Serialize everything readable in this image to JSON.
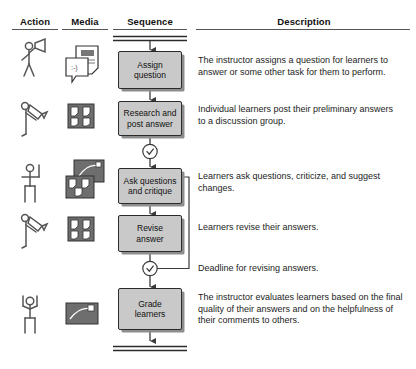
{
  "diagram": {
    "type": "activity-flow-table",
    "columns": [
      {
        "id": "action",
        "label": "Action"
      },
      {
        "id": "media",
        "label": "Media"
      },
      {
        "id": "sequence",
        "label": "Sequence"
      },
      {
        "id": "description",
        "label": "Description"
      }
    ],
    "colors": {
      "box_fill": "#c9c9c9",
      "box_border": "#2b2b2b",
      "box_shadow": "#8d8d8d",
      "connector": "#3a3a3a",
      "media_tile": "#6e6e6e",
      "text": "#1a1a1a",
      "rule": "#555555",
      "background": "#ffffff"
    },
    "start_marker": "double-bar",
    "end_marker": "double-bar",
    "rows": [
      {
        "index": 1,
        "actor_icon": "stick-figure-with-megaphone-icon",
        "media_icon": "document-with-comment-note-icon",
        "step_label": "Assign question",
        "step_line_1": "Assign",
        "step_line_2": "question",
        "description": "The instructor assigns a question for learners to answer or some other task for them to perform."
      },
      {
        "index": 2,
        "actor_icon": "stick-figure-writing-icon",
        "media_icon": "note-grid-four-tiles-icon",
        "step_label": "Research and post answer",
        "step_line_1": "Research and",
        "step_line_2": "post answer",
        "description": "Individual learners post their preliminary answers to a discussion group."
      },
      {
        "index": 3,
        "actor_icon": "stick-figure-hand-raised-icon",
        "media_icon": "stacked-note-tiles-icon",
        "step_label": "Ask questions and critique",
        "step_line_1": "Ask questions",
        "step_line_2": "and critique",
        "description": "Learners ask questions, criticize, and suggest changes."
      },
      {
        "index": 4,
        "actor_icon": "stick-figure-writing-icon",
        "media_icon": "note-grid-four-tiles-icon",
        "step_label": "Revise answer",
        "step_line_1": "Revise",
        "step_line_2": "answer",
        "description": "Learners revise their answers."
      },
      {
        "index": 5,
        "actor_icon": "stick-figure-arms-raised-icon",
        "media_icon": "single-tile-with-pen-icon",
        "step_label": "Grade learners",
        "step_line_1": "Grade",
        "step_line_2": "learners",
        "description": "The instructor evaluates learners based on the final quality of their answers and on the helpfulness of their comments to others."
      }
    ],
    "timers": [
      {
        "index": 1,
        "icon": "clock-timer-icon",
        "label": "",
        "after_step": "Research and post answer"
      },
      {
        "index": 2,
        "icon": "clock-timer-icon",
        "label": "Deadline for revising answers.",
        "after_step": "Revise answer"
      }
    ],
    "feedback_loop": {
      "from": "Deadline for revising answers.",
      "to": "Ask questions and critique",
      "arrow": "left-pointing"
    }
  }
}
